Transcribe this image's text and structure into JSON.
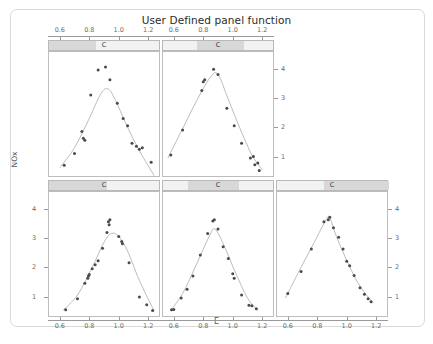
{
  "title": "User Defined panel function",
  "axes": {
    "x_label": "E",
    "y_label": "NOx",
    "x_ticks": [
      "0.6",
      "0.8",
      "1.0",
      "1.2"
    ],
    "y_ticks": [
      "1",
      "2",
      "3",
      "4"
    ]
  },
  "strip_label": "C",
  "chart_data": {
    "type": "scatter",
    "title": "User Defined panel function",
    "xlabel": "E",
    "ylabel": "NOx",
    "xlim": [
      0.52,
      1.28
    ],
    "ylim": [
      0.3,
      4.6
    ],
    "x_ticks": [
      0.6,
      0.8,
      1.0,
      1.2
    ],
    "y_ticks": [
      1,
      2,
      3,
      4
    ],
    "grid": false,
    "legend": null,
    "layout": {
      "rows": 2,
      "cols": 3,
      "panel_order": "bottom-left-to-top-right"
    },
    "conditioning_variable": "C",
    "strip_label": "C",
    "panels": [
      {
        "name": "panel-row1-col1",
        "row": 1,
        "col": 1,
        "strip_label": "C",
        "strip_fill": [
          0.0,
          0.42
        ],
        "axis_top": true,
        "axis_left": false,
        "axis_right": false,
        "axis_bottom": false,
        "points": [
          [
            0.63,
            0.7
          ],
          [
            0.7,
            1.1
          ],
          [
            0.75,
            1.85
          ],
          [
            0.76,
            1.62
          ],
          [
            0.77,
            1.55
          ],
          [
            0.81,
            3.1
          ],
          [
            0.86,
            3.95
          ],
          [
            0.91,
            4.05
          ],
          [
            0.94,
            3.62
          ],
          [
            0.99,
            2.82
          ],
          [
            1.03,
            2.3
          ],
          [
            1.06,
            2.05
          ],
          [
            1.09,
            1.45
          ],
          [
            1.12,
            1.35
          ],
          [
            1.14,
            1.25
          ],
          [
            1.16,
            1.3
          ],
          [
            1.22,
            0.8
          ]
        ],
        "curve": [
          [
            0.6,
            0.62
          ],
          [
            0.7,
            1.3
          ],
          [
            0.8,
            2.3
          ],
          [
            0.88,
            3.15
          ],
          [
            0.93,
            3.3
          ],
          [
            0.98,
            2.9
          ],
          [
            1.05,
            2.1
          ],
          [
            1.14,
            1.2
          ],
          [
            1.24,
            0.35
          ]
        ]
      },
      {
        "name": "panel-row1-col2",
        "row": 1,
        "col": 2,
        "strip_label": "C",
        "strip_fill": [
          0.3,
          0.72
        ],
        "axis_top": true,
        "axis_left": false,
        "axis_right": true,
        "axis_bottom": false,
        "points": [
          [
            0.58,
            1.05
          ],
          [
            0.66,
            1.9
          ],
          [
            0.79,
            3.25
          ],
          [
            0.8,
            3.55
          ],
          [
            0.81,
            3.62
          ],
          [
            0.87,
            3.98
          ],
          [
            0.9,
            3.8
          ],
          [
            0.96,
            2.65
          ],
          [
            1.01,
            2.05
          ],
          [
            1.06,
            1.45
          ],
          [
            1.12,
            0.95
          ],
          [
            1.14,
            1.0
          ],
          [
            1.15,
            0.72
          ],
          [
            1.17,
            0.78
          ],
          [
            1.18,
            0.52
          ]
        ],
        "curve": [
          [
            0.56,
            0.95
          ],
          [
            0.66,
            1.95
          ],
          [
            0.76,
            2.95
          ],
          [
            0.85,
            3.72
          ],
          [
            0.9,
            3.8
          ],
          [
            0.97,
            2.95
          ],
          [
            1.05,
            1.95
          ],
          [
            1.13,
            1.05
          ],
          [
            1.2,
            0.55
          ]
        ]
      },
      {
        "name": "panel-row2-col1",
        "row": 2,
        "col": 1,
        "strip_label": "C",
        "strip_fill": [
          0.0,
          0.52
        ],
        "axis_top": false,
        "axis_left": true,
        "axis_right": false,
        "axis_bottom": true,
        "points": [
          [
            0.64,
            0.55
          ],
          [
            0.72,
            0.92
          ],
          [
            0.77,
            1.45
          ],
          [
            0.79,
            1.62
          ],
          [
            0.795,
            1.7
          ],
          [
            0.8,
            1.75
          ],
          [
            0.82,
            1.95
          ],
          [
            0.84,
            2.08
          ],
          [
            0.86,
            2.22
          ],
          [
            0.89,
            2.65
          ],
          [
            0.92,
            3.18
          ],
          [
            0.93,
            3.55
          ],
          [
            0.935,
            3.45
          ],
          [
            0.94,
            3.62
          ],
          [
            1.0,
            3.05
          ],
          [
            1.02,
            2.88
          ],
          [
            1.025,
            2.8
          ],
          [
            1.07,
            2.15
          ],
          [
            1.14,
            0.98
          ],
          [
            1.19,
            0.72
          ],
          [
            1.23,
            0.52
          ]
        ],
        "curve": [
          [
            0.62,
            0.52
          ],
          [
            0.72,
            1.05
          ],
          [
            0.82,
            2.0
          ],
          [
            0.9,
            2.85
          ],
          [
            0.95,
            3.15
          ],
          [
            1.0,
            3.05
          ],
          [
            1.06,
            2.55
          ],
          [
            1.14,
            1.55
          ],
          [
            1.24,
            0.5
          ]
        ]
      },
      {
        "name": "panel-row2-col2",
        "row": 2,
        "col": 2,
        "strip_label": "C",
        "strip_fill": [
          0.22,
          0.68
        ],
        "axis_top": false,
        "axis_left": false,
        "axis_right": false,
        "axis_bottom": true,
        "points": [
          [
            0.585,
            0.55
          ],
          [
            0.6,
            0.56
          ],
          [
            0.65,
            0.95
          ],
          [
            0.69,
            1.25
          ],
          [
            0.73,
            1.7
          ],
          [
            0.78,
            2.42
          ],
          [
            0.83,
            3.15
          ],
          [
            0.865,
            3.58
          ],
          [
            0.875,
            3.62
          ],
          [
            0.9,
            3.3
          ],
          [
            0.935,
            2.7
          ],
          [
            0.97,
            2.3
          ],
          [
            1.0,
            1.78
          ],
          [
            1.01,
            1.62
          ],
          [
            1.06,
            1.05
          ],
          [
            1.11,
            0.7
          ],
          [
            1.13,
            0.68
          ],
          [
            1.16,
            0.58
          ]
        ],
        "curve": [
          [
            0.575,
            0.5
          ],
          [
            0.66,
            1.1
          ],
          [
            0.75,
            2.05
          ],
          [
            0.84,
            3.05
          ],
          [
            0.88,
            3.3
          ],
          [
            0.94,
            2.75
          ],
          [
            1.02,
            1.8
          ],
          [
            1.1,
            0.95
          ],
          [
            1.17,
            0.52
          ]
        ]
      },
      {
        "name": "panel-row2-col3",
        "row": 2,
        "col": 3,
        "strip_label": "C",
        "strip_fill": [
          0.42,
          1.0
        ],
        "axis_top": false,
        "axis_left": false,
        "axis_right": true,
        "axis_bottom": true,
        "points": [
          [
            0.6,
            1.1
          ],
          [
            0.69,
            1.85
          ],
          [
            0.76,
            2.62
          ],
          [
            0.845,
            3.55
          ],
          [
            0.875,
            3.62
          ],
          [
            0.885,
            3.7
          ],
          [
            0.91,
            3.35
          ],
          [
            0.945,
            3.02
          ],
          [
            0.975,
            2.62
          ],
          [
            1.0,
            2.2
          ],
          [
            1.02,
            2.05
          ],
          [
            1.05,
            1.72
          ],
          [
            1.09,
            1.3
          ],
          [
            1.12,
            1.08
          ],
          [
            1.145,
            0.92
          ],
          [
            1.165,
            0.82
          ]
        ],
        "curve": [
          [
            0.585,
            0.95
          ],
          [
            0.68,
            1.9
          ],
          [
            0.78,
            2.85
          ],
          [
            0.86,
            3.62
          ],
          [
            0.885,
            3.68
          ],
          [
            0.93,
            3.05
          ],
          [
            1.01,
            2.12
          ],
          [
            1.09,
            1.35
          ],
          [
            1.18,
            0.78
          ]
        ]
      }
    ]
  }
}
